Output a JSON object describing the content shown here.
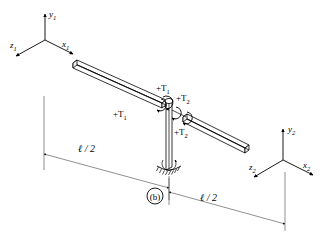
{
  "figure": {
    "label": "(b)",
    "background_color": "#ffffff",
    "line_color": "#000000",
    "dim_line_color": "#444444"
  },
  "coordinate_systems": [
    {
      "name": "left-frame",
      "origin_px": [
        45,
        40
      ],
      "axes": [
        {
          "id": "y1",
          "base": "y",
          "subscript": "1",
          "direction": "up"
        },
        {
          "id": "x1",
          "base": "x",
          "subscript": "1",
          "direction": "lower-right"
        },
        {
          "id": "z1",
          "base": "z",
          "subscript": "1",
          "direction": "lower-left"
        }
      ]
    },
    {
      "name": "right-frame",
      "origin_px": [
        283,
        160
      ],
      "axes": [
        {
          "id": "y2",
          "base": "y",
          "subscript": "2",
          "direction": "up"
        },
        {
          "id": "x2",
          "base": "x",
          "subscript": "2",
          "direction": "lower-right"
        },
        {
          "id": "z2",
          "base": "z",
          "subscript": "2",
          "direction": "lower-left"
        }
      ]
    }
  ],
  "torque_labels": [
    {
      "id": "t1-left-beam",
      "text": "+T",
      "subscript": "1"
    },
    {
      "id": "t1-column-top",
      "text": "+T",
      "subscript": "1"
    },
    {
      "id": "t2-upper",
      "text": "+T",
      "subscript": "2"
    },
    {
      "id": "t2-lower",
      "text": "+T",
      "subscript": "2"
    }
  ],
  "dimensions": [
    {
      "id": "left-half-span",
      "text": "ℓ / 2"
    },
    {
      "id": "right-half-span",
      "text": "ℓ / 2"
    }
  ],
  "members": [
    {
      "id": "left-beam",
      "type": "rectangular-bar"
    },
    {
      "id": "right-beam",
      "type": "rectangular-bar"
    },
    {
      "id": "center-column",
      "type": "vertical-column"
    }
  ]
}
